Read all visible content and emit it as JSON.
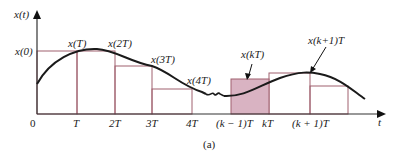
{
  "figure": {
    "y_axis_label": "x(t)",
    "x_axis_label": "t",
    "caption": "(a)",
    "y_tick_label": "x(0)",
    "x_ticks": [
      "0",
      "T",
      "2T",
      "3T",
      "4T",
      "(k − 1)T",
      "kT",
      "(k + 1)T"
    ],
    "sample_labels": [
      "x(T)",
      "x(2T)",
      "x(3T)",
      "x(4T)",
      "x(kT)",
      "x(k+1)T"
    ],
    "colors": {
      "curve": "#1a1a1a",
      "rect_stroke": "#a0606e",
      "shaded_fill": "#d9b3c2",
      "axis": "#333333"
    }
  }
}
